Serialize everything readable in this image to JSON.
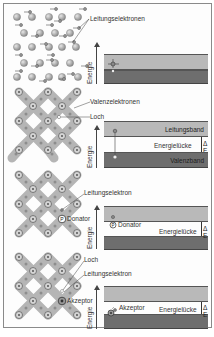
{
  "colors": {
    "band_light": "#b9b9b9",
    "band_dark": "#6e6e6e",
    "lattice_bond": "#b0b0b0",
    "atom": "#9a9a9a",
    "frame": "#8a8a8a"
  },
  "axis_label": "Energie",
  "panels": [
    {
      "id": "metal",
      "labels": {
        "conduction_electrons": "Leitungselektronen"
      },
      "bands": {
        "upper": "",
        "lower": ""
      }
    },
    {
      "id": "intrinsic",
      "labels": {
        "valence_electrons": "Valenzelektronen",
        "hole": "Loch"
      },
      "bands": {
        "upper": "Leitungsband",
        "gap": "Energielücke",
        "lower": "Valenzband",
        "delta": "Δ E"
      }
    },
    {
      "id": "n-type",
      "labels": {
        "conduction_electron": "Leitungselektron",
        "donor": "Donator"
      },
      "bands": {
        "donor_level": "Donator",
        "gap": "Energielücke",
        "delta": "Δ E"
      }
    },
    {
      "id": "p-type",
      "labels": {
        "hole": "Loch",
        "conduction_electron": "Leitungselektron",
        "acceptor": "Akzeptor"
      },
      "bands": {
        "acceptor_level": "Akzeptor",
        "gap": "Energielücke",
        "delta": "Δ E"
      }
    }
  ],
  "atom_symbols": {
    "donor": "P",
    "acceptor": "B",
    "lattice": "Si"
  }
}
